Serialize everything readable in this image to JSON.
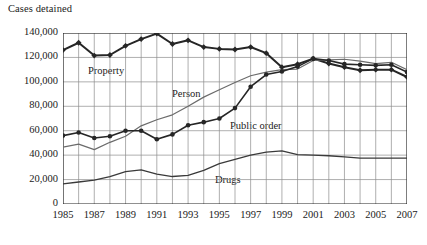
{
  "chart_data": {
    "type": "line",
    "title": "",
    "ylabel": "Cases detained",
    "xlabel": "",
    "ylim": [
      0,
      140000
    ],
    "ytick_values": [
      0,
      20000,
      40000,
      60000,
      80000,
      100000,
      120000,
      140000
    ],
    "ytick_labels": [
      "0",
      "20,000",
      "40,000",
      "60,000",
      "80,000",
      "100,000",
      "120,000",
      "140,000"
    ],
    "grid": true,
    "legend": "inline-annotations",
    "x": [
      1985,
      1986,
      1987,
      1988,
      1989,
      1990,
      1991,
      1992,
      1993,
      1994,
      1995,
      1996,
      1997,
      1998,
      1999,
      2000,
      2001,
      2002,
      2003,
      2004,
      2005,
      2006,
      2007
    ],
    "xtick_labels": [
      "1985",
      "",
      "1987",
      "",
      "1989",
      "",
      "1991",
      "",
      "1993",
      "",
      "1995",
      "",
      "1997",
      "",
      "1999",
      "",
      "2001",
      "",
      "2003",
      "",
      "2005",
      "",
      "2007"
    ],
    "xtick_shown": [
      "1985",
      "1987",
      "1989",
      "1991",
      "1993",
      "1995",
      "1997",
      "1999",
      "2001",
      "2003",
      "2005",
      "2007"
    ],
    "series": [
      {
        "name": "Property",
        "marker": "diamond",
        "color": "#262626",
        "width": 2.0,
        "values": [
          126000,
          132000,
          121500,
          122000,
          129500,
          135000,
          139500,
          131000,
          134000,
          128500,
          127000,
          126500,
          128500,
          123500,
          112000,
          114500,
          119000,
          115000,
          112000,
          109500,
          110000,
          110000,
          104000
        ]
      },
      {
        "name": "Person",
        "marker": "none",
        "color": "#6b6b6b",
        "width": 1.2,
        "values": [
          46500,
          49000,
          44500,
          50500,
          55500,
          64000,
          69000,
          73000,
          80000,
          87500,
          93500,
          99500,
          105000,
          108000,
          110000,
          110500,
          117500,
          118000,
          118500,
          117000,
          115000,
          116000,
          110000
        ]
      },
      {
        "name": "Public order",
        "marker": "circle",
        "color": "#262626",
        "width": 1.6,
        "values": [
          56000,
          58500,
          54000,
          55500,
          60000,
          60000,
          53000,
          57000,
          64500,
          67000,
          70000,
          78500,
          96000,
          106000,
          108500,
          112500,
          119000,
          117500,
          114500,
          114000,
          113500,
          114000,
          108000
        ]
      },
      {
        "name": "Drugs",
        "marker": "none",
        "color": "#3a3a3a",
        "width": 1.3,
        "values": [
          16500,
          18000,
          19500,
          22500,
          26500,
          28000,
          24500,
          22500,
          23500,
          27500,
          33000,
          36500,
          40000,
          42500,
          43500,
          40500,
          40000,
          39500,
          38500,
          37500,
          37500,
          37500,
          37500
        ]
      }
    ],
    "annotations": [
      {
        "text": "Property",
        "x_px": 88,
        "y_px": 65
      },
      {
        "text": "Person",
        "x_px": 172,
        "y_px": 88
      },
      {
        "text": "Public order",
        "x_px": 230,
        "y_px": 120
      },
      {
        "text": "Drugs",
        "x_px": 215,
        "y_px": 174
      }
    ]
  }
}
